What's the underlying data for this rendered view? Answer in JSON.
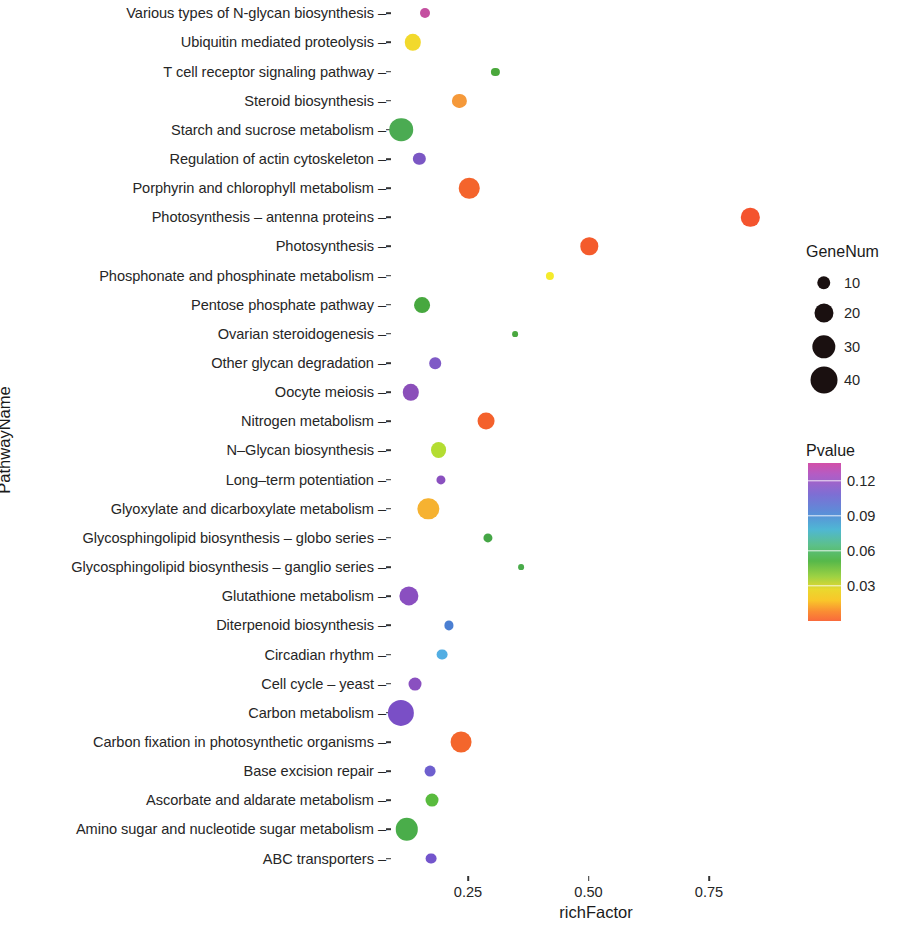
{
  "chart_data": {
    "type": "scatter",
    "title": "",
    "xlabel": "richFactor",
    "ylabel": "PathwayName",
    "xlim": [
      0.085,
      0.905
    ],
    "xticks": [
      0.25,
      0.5,
      0.75
    ],
    "xtick_labels": [
      "0.25",
      "0.50",
      "0.75"
    ],
    "grid": false,
    "legend_position": "right",
    "size_legend": {
      "title": "GeneNum",
      "values": [
        10,
        20,
        30,
        40
      ],
      "labels": [
        "10",
        "20",
        "30",
        "40"
      ]
    },
    "color_legend": {
      "title": "Pvalue",
      "ticks": [
        0.12,
        0.09,
        0.06,
        0.03
      ],
      "tick_labels": [
        "0.12",
        "0.09",
        "0.06",
        "0.03"
      ],
      "vmin": 0.0,
      "vmax": 0.135,
      "palette": "rainbow-reversed"
    },
    "categories": [
      "Various types of N-glycan biosynthesis",
      "Ubiquitin mediated proteolysis",
      "T cell receptor signaling pathway",
      "Steroid biosynthesis",
      "Starch and sucrose metabolism",
      "Regulation of actin cytoskeleton",
      "Porphyrin and chlorophyll metabolism",
      "Photosynthesis – antenna proteins",
      "Photosynthesis",
      "Phosphonate and phosphinate metabolism",
      "Pentose phosphate pathway",
      "Ovarian steroidogenesis",
      "Other glycan degradation",
      "Oocyte meiosis",
      "Nitrogen metabolism",
      "N–Glycan biosynthesis",
      "Long–term potentiation",
      "Glyoxylate and dicarboxylate metabolism",
      "Glycosphingolipid biosynthesis – globo series",
      "Glycosphingolipid biosynthesis – ganglio series",
      "Glutathione metabolism",
      "Diterpenoid biosynthesis",
      "Circadian rhythm",
      "Cell cycle – yeast",
      "Carbon metabolism",
      "Carbon fixation in photosynthetic organisms",
      "Base excision repair",
      "Ascorbate and aldarate metabolism",
      "Amino sugar and nucleotide sugar metabolism",
      "ABC transporters"
    ],
    "points": [
      {
        "pathway": "Various types of N-glycan biosynthesis",
        "richFactor": 0.161,
        "GeneNum": 6,
        "Pvalue": 0.127,
        "color": "#c44fa0"
      },
      {
        "pathway": "Ubiquitin mediated proteolysis",
        "richFactor": 0.136,
        "GeneNum": 16,
        "Pvalue": 0.031,
        "color": "#f2d92c"
      },
      {
        "pathway": "T cell receptor signaling pathway",
        "richFactor": 0.307,
        "GeneNum": 4,
        "Pvalue": 0.055,
        "color": "#4aa83c"
      },
      {
        "pathway": "Steroid biosynthesis",
        "richFactor": 0.232,
        "GeneNum": 12,
        "Pvalue": 0.02,
        "color": "#f5993a"
      },
      {
        "pathway": "Starch and sucrose metabolism",
        "richFactor": 0.111,
        "GeneNum": 33,
        "Pvalue": 0.053,
        "color": "#4bab52"
      },
      {
        "pathway": "Regulation of actin cytoskeleton",
        "richFactor": 0.149,
        "GeneNum": 9,
        "Pvalue": 0.098,
        "color": "#7b57c4"
      },
      {
        "pathway": "Porphyrin and chlorophyll metabolism",
        "richFactor": 0.253,
        "GeneNum": 25,
        "Pvalue": 0.011,
        "color": "#f4642c"
      },
      {
        "pathway": "Photosynthesis – antenna proteins",
        "richFactor": 0.836,
        "GeneNum": 20,
        "Pvalue": 0.008,
        "color": "#f4542e"
      },
      {
        "pathway": "Photosynthesis",
        "richFactor": 0.502,
        "GeneNum": 18,
        "Pvalue": 0.01,
        "color": "#f45b2c"
      },
      {
        "pathway": "Phosphonate and phosphinate metabolism",
        "richFactor": 0.42,
        "GeneNum": 4,
        "Pvalue": 0.029,
        "color": "#f5eb2b"
      },
      {
        "pathway": "Pentose phosphate pathway",
        "richFactor": 0.155,
        "GeneNum": 15,
        "Pvalue": 0.05,
        "color": "#47a83f"
      },
      {
        "pathway": "Ovarian steroidogenesis",
        "richFactor": 0.348,
        "GeneNum": 2,
        "Pvalue": 0.055,
        "color": "#4aa83f"
      },
      {
        "pathway": "Other glycan degradation",
        "richFactor": 0.182,
        "GeneNum": 8,
        "Pvalue": 0.099,
        "color": "#7f5ac6"
      },
      {
        "pathway": "Oocyte meiosis",
        "richFactor": 0.131,
        "GeneNum": 16,
        "Pvalue": 0.104,
        "color": "#8b4fba"
      },
      {
        "pathway": "Nitrogen metabolism",
        "richFactor": 0.287,
        "GeneNum": 17,
        "Pvalue": 0.012,
        "color": "#f4612c"
      },
      {
        "pathway": "N–Glycan biosynthesis",
        "richFactor": 0.189,
        "GeneNum": 15,
        "Pvalue": 0.037,
        "color": "#b4dd32"
      },
      {
        "pathway": "Long–term potentiation",
        "richFactor": 0.193,
        "GeneNum": 5,
        "Pvalue": 0.105,
        "color": "#8a50bf"
      },
      {
        "pathway": "Glyoxylate and dicarboxylate metabolism",
        "richFactor": 0.168,
        "GeneNum": 27,
        "Pvalue": 0.024,
        "color": "#f6b231"
      },
      {
        "pathway": "Glycosphingolipid biosynthesis – globo series",
        "richFactor": 0.291,
        "GeneNum": 5,
        "Pvalue": 0.056,
        "color": "#45a646"
      },
      {
        "pathway": "Glycosphingolipid biosynthesis – ganglio series",
        "richFactor": 0.36,
        "GeneNum": 2,
        "Pvalue": 0.057,
        "color": "#49ab4a"
      },
      {
        "pathway": "Glutathione metabolism",
        "richFactor": 0.128,
        "GeneNum": 22,
        "Pvalue": 0.102,
        "color": "#8a4fc0"
      },
      {
        "pathway": "Diterpenoid biosynthesis",
        "richFactor": 0.21,
        "GeneNum": 5,
        "Pvalue": 0.085,
        "color": "#4b7fd2"
      },
      {
        "pathway": "Circadian rhythm",
        "richFactor": 0.197,
        "GeneNum": 7,
        "Pvalue": 0.079,
        "color": "#53aee3"
      },
      {
        "pathway": "Cell cycle – yeast",
        "richFactor": 0.141,
        "GeneNum": 10,
        "Pvalue": 0.103,
        "color": "#8a50c0"
      },
      {
        "pathway": "Carbon metabolism",
        "richFactor": 0.11,
        "GeneNum": 41,
        "Pvalue": 0.108,
        "color": "#7a4fc6"
      },
      {
        "pathway": "Carbon fixation in photosynthetic organisms",
        "richFactor": 0.236,
        "GeneNum": 26,
        "Pvalue": 0.013,
        "color": "#f4662c"
      },
      {
        "pathway": "Base excision repair",
        "richFactor": 0.172,
        "GeneNum": 7,
        "Pvalue": 0.096,
        "color": "#6e5fce"
      },
      {
        "pathway": "Ascorbate and aldarate metabolism",
        "richFactor": 0.175,
        "GeneNum": 10,
        "Pvalue": 0.046,
        "color": "#59bb3e"
      },
      {
        "pathway": "Amino sugar and nucleotide sugar metabolism",
        "richFactor": 0.123,
        "GeneNum": 30,
        "Pvalue": 0.05,
        "color": "#4aad4a"
      },
      {
        "pathway": "ABC transporters",
        "richFactor": 0.174,
        "GeneNum": 7,
        "Pvalue": 0.099,
        "color": "#7355cc"
      }
    ]
  }
}
